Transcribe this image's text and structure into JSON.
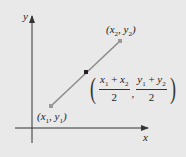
{
  "diagram": {
    "axes": {
      "x_label": "x",
      "y_label": "y"
    },
    "points": {
      "p1": {
        "label_var_x": "x",
        "label_sub_x": "1",
        "label_var_y": "y",
        "label_sub_y": "1"
      },
      "p2": {
        "label_var_x": "x",
        "label_sub_x": "2",
        "label_var_y": "y",
        "label_sub_y": "2"
      }
    },
    "midpoint": {
      "num1": {
        "a": "x",
        "a_sub": "1",
        "op": " + ",
        "b": "x",
        "b_sub": "2"
      },
      "den1": "2",
      "num2": {
        "a": "y",
        "a_sub": "1",
        "op": " + ",
        "b": "y",
        "b_sub": "2"
      },
      "den2": "2",
      "comma": ","
    },
    "colors": {
      "background": "#e9e9e9",
      "axis": "#333333",
      "segment": "#8a8a8a",
      "midpoint": "#222222"
    }
  }
}
